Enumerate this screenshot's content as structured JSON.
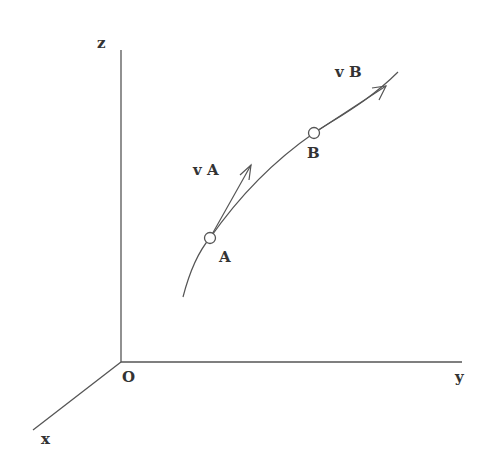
{
  "diagram": {
    "type": "3d-coordinate-curve-velocity",
    "axes": {
      "x_label": "x",
      "y_label": "y",
      "z_label": "z",
      "origin_label": "O"
    },
    "points": [
      {
        "label": "A",
        "velocity_label": "v A"
      },
      {
        "label": "B",
        "velocity_label": "v B"
      }
    ],
    "colors": {
      "stroke": "#555555",
      "text": "#333333",
      "background": "#ffffff"
    }
  }
}
